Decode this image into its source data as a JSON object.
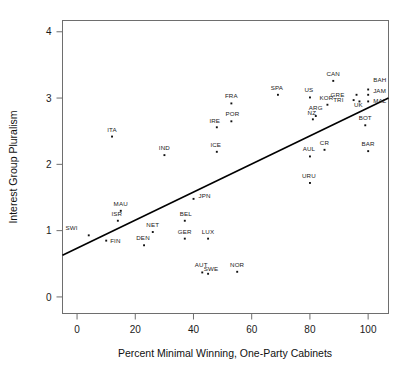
{
  "chart_data": {
    "type": "scatter",
    "title": "",
    "xlabel": "Percent Minimal Winning, One-Party Cabinets",
    "ylabel": "Interest Group Pluralism",
    "xlim": [
      -5,
      107
    ],
    "ylim": [
      -0.25,
      4.17
    ],
    "xticks": [
      0,
      20,
      40,
      60,
      80,
      100
    ],
    "xticklabels": [
      "0",
      "20",
      "40",
      "60",
      "80",
      "100"
    ],
    "yticks": [
      0,
      1,
      2,
      3,
      4
    ],
    "yticklabels": [
      "0",
      "1",
      "2",
      "3",
      "4"
    ],
    "grid": false,
    "legend": null,
    "marker": "point",
    "marker_color": "#111111",
    "trendline": {
      "type": "linear",
      "color": "#000000",
      "x_start": -5,
      "y_start": 0.63,
      "x_end": 107,
      "y_end": 3.0,
      "slope": 0.0212,
      "intercept": 0.736
    },
    "points": [
      {
        "label": "SWI",
        "x": 4,
        "y": 0.93,
        "lx": -11,
        "ly": -5
      },
      {
        "label": "FIN",
        "x": 10,
        "y": 0.85,
        "lx": 4,
        "ly": 2
      },
      {
        "label": "ISR",
        "x": 14,
        "y": 1.15,
        "lx": -1,
        "ly": -5
      },
      {
        "label": "MAU",
        "x": 15,
        "y": 1.3,
        "lx": 0,
        "ly": -5
      },
      {
        "label": "ITA",
        "x": 12,
        "y": 2.42,
        "lx": 0,
        "ly": -5
      },
      {
        "label": "DEN",
        "x": 23,
        "y": 0.78,
        "lx": -1,
        "ly": -5
      },
      {
        "label": "NET",
        "x": 26,
        "y": 0.98,
        "lx": 0,
        "ly": -5
      },
      {
        "label": "IND",
        "x": 30,
        "y": 2.14,
        "lx": 0,
        "ly": -5
      },
      {
        "label": "GER",
        "x": 37,
        "y": 0.88,
        "lx": 0,
        "ly": -5
      },
      {
        "label": "BEL",
        "x": 37,
        "y": 1.15,
        "lx": 1,
        "ly": -5
      },
      {
        "label": "JPN",
        "x": 40,
        "y": 1.48,
        "lx": 5,
        "ly": -1
      },
      {
        "label": "AUT",
        "x": 43,
        "y": 0.37,
        "lx": -1,
        "ly": -5
      },
      {
        "label": "LUX",
        "x": 45,
        "y": 0.88,
        "lx": 0,
        "ly": -5
      },
      {
        "label": "SWE",
        "x": 45,
        "y": 0.35,
        "lx": 3,
        "ly": -3
      },
      {
        "label": "ICE",
        "x": 48,
        "y": 2.19,
        "lx": -1,
        "ly": -5
      },
      {
        "label": "IRE",
        "x": 48,
        "y": 2.56,
        "lx": -2,
        "ly": -4
      },
      {
        "label": "POR",
        "x": 53,
        "y": 2.65,
        "lx": 1,
        "ly": -5
      },
      {
        "label": "FRA",
        "x": 53,
        "y": 2.92,
        "lx": 0,
        "ly": -5
      },
      {
        "label": "NOR",
        "x": 55,
        "y": 0.38,
        "lx": 0,
        "ly": -5
      },
      {
        "label": "SPA",
        "x": 69,
        "y": 3.05,
        "lx": -1,
        "ly": -5
      },
      {
        "label": "AUL",
        "x": 80,
        "y": 2.12,
        "lx": -1,
        "ly": -5
      },
      {
        "label": "URU",
        "x": 80,
        "y": 1.72,
        "lx": -1,
        "ly": -5
      },
      {
        "label": "US",
        "x": 80,
        "y": 3.01,
        "lx": -1,
        "ly": -5
      },
      {
        "label": "NZ",
        "x": 81,
        "y": 2.68,
        "lx": -1,
        "ly": -4
      },
      {
        "label": "ARG",
        "x": 82,
        "y": 2.73,
        "lx": 0,
        "ly": -6
      },
      {
        "label": "CR",
        "x": 85,
        "y": 2.22,
        "lx": 0,
        "ly": -5
      },
      {
        "label": "KOR",
        "x": 86,
        "y": 2.9,
        "lx": -1,
        "ly": -5
      },
      {
        "label": "CAN",
        "x": 88,
        "y": 3.26,
        "lx": 0,
        "ly": -5
      },
      {
        "label": "TRI",
        "x": 95,
        "y": 2.97,
        "lx": -10,
        "ly": 2
      },
      {
        "label": "GRE",
        "x": 96,
        "y": 3.05,
        "lx": -12,
        "ly": 2
      },
      {
        "label": "UK",
        "x": 97,
        "y": 2.95,
        "lx": -1,
        "ly": 6
      },
      {
        "label": "BOT",
        "x": 99,
        "y": 2.59,
        "lx": 0,
        "ly": -5
      },
      {
        "label": "BAR",
        "x": 100,
        "y": 2.2,
        "lx": 0,
        "ly": -5
      },
      {
        "label": "MAL",
        "x": 100,
        "y": 2.95,
        "lx": 5,
        "ly": 2
      },
      {
        "label": "JAM",
        "x": 100,
        "y": 3.05,
        "lx": 5,
        "ly": -2
      },
      {
        "label": "BAH",
        "x": 100,
        "y": 3.13,
        "lx": 5,
        "ly": -7
      }
    ]
  }
}
